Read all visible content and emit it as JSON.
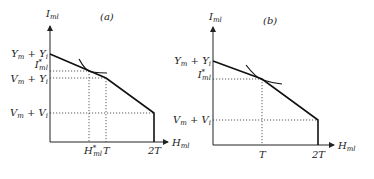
{
  "panels": [
    {
      "id": "a",
      "title": "(a)",
      "y_axis_label": "I_ml",
      "x_axis_label": "H_ml",
      "y_ticks": [
        {
          "label": "Y_m + Y_i",
          "main": "Y",
          "sub": "m",
          "op": "+",
          "main2": "Y",
          "sub2": "i"
        },
        {
          "label": "I*_ml",
          "main": "I",
          "sup": "*",
          "sub": "ml"
        },
        {
          "label": "V_m + Y_i",
          "main": "V",
          "sub": "m",
          "op": "+",
          "main2": "Y",
          "sub2": "i"
        },
        {
          "label": "V_m + V_i",
          "main": "V",
          "sub": "m",
          "op": "+",
          "main2": "V",
          "sub2": "i"
        }
      ],
      "x_ticks": [
        {
          "label": "H*_ml",
          "main": "H",
          "sup": "*",
          "sub": "ml"
        },
        {
          "label": "T"
        },
        {
          "label": "2T"
        }
      ],
      "description": "Kinked budget line with optimum (tangency) at H*_ml < T on the upper segment"
    },
    {
      "id": "b",
      "title": "(b)",
      "y_axis_label": "I_ml",
      "x_axis_label": "H_ml",
      "y_ticks": [
        {
          "label": "Y_m + Y_i",
          "main": "Y",
          "sub": "m",
          "op": "+",
          "main2": "Y",
          "sub2": "i"
        },
        {
          "label": "I*_ml",
          "main": "I",
          "sup": "*",
          "sub": "ml"
        },
        {
          "label": "V_m + V_i",
          "main": "V",
          "sub": "m",
          "op": "+",
          "main2": "V",
          "sub2": "i"
        }
      ],
      "x_ticks": [
        {
          "label": "T"
        },
        {
          "label": "2T"
        }
      ],
      "description": "Budget line with optimum at the kink H_ml = T"
    }
  ]
}
